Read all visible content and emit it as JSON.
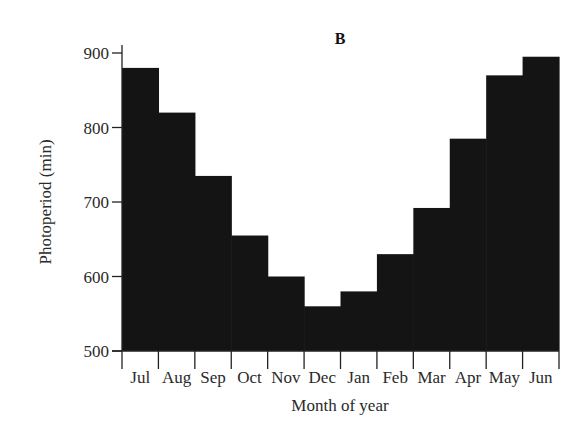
{
  "chart_data": {
    "type": "bar",
    "title": "B",
    "xlabel": "Month of year",
    "ylabel": "Photoperiod (min)",
    "ylim": [
      500,
      900
    ],
    "yticks": [
      500,
      600,
      700,
      800,
      900
    ],
    "grid": false,
    "legend": null,
    "categories": [
      "Jul",
      "Aug",
      "Sep",
      "Oct",
      "Nov",
      "Dec",
      "Jan",
      "Feb",
      "Mar",
      "Apr",
      "May",
      "Jun"
    ],
    "values": [
      880,
      820,
      735,
      655,
      600,
      560,
      580,
      630,
      692,
      785,
      870,
      895
    ],
    "bar_color": "#141414"
  }
}
